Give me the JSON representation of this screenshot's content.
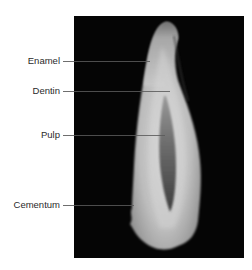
{
  "figure": {
    "type": "labeled-photograph",
    "background_color": "#050505",
    "labels": [
      {
        "text": "Enamel",
        "y": 61
      },
      {
        "text": "Dentin",
        "y": 91
      },
      {
        "text": "Pulp",
        "y": 135
      },
      {
        "text": "Cementum",
        "y": 205
      }
    ]
  }
}
